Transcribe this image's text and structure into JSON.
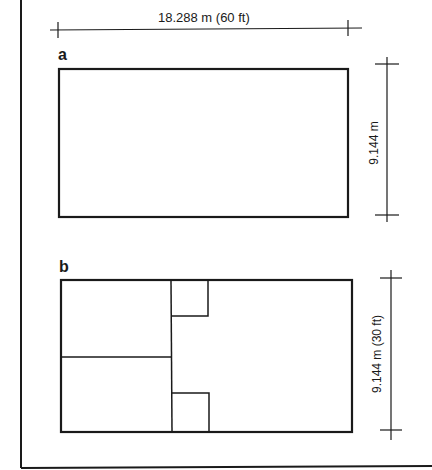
{
  "figure": {
    "top_dimension": "18.288 m (60 ft)",
    "panel_a": {
      "label": "a",
      "height_dimension": "9.144 m"
    },
    "panel_b": {
      "label": "b",
      "height_dimension": "9.144 m (30 ft)"
    }
  },
  "colors": {
    "line": "#1a1a1a",
    "background": "#ffffff"
  }
}
